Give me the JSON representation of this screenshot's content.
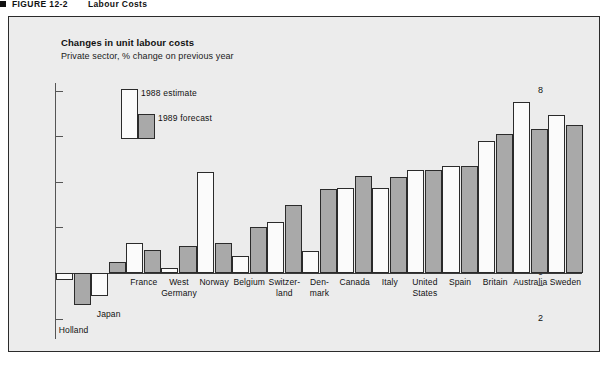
{
  "figure": {
    "marker": "square-bullet",
    "number": "FIGURE 12-2",
    "name": "Labour Costs"
  },
  "chart": {
    "title": "Changes in unit labour costs",
    "subtitle": "Private sector, % change on previous year"
  },
  "legend": {
    "series_1988": "1988 estimate",
    "series_1989": "1989 forecast"
  },
  "axis": {
    "ticks": [
      "8",
      "6",
      "4",
      "2",
      "0",
      "2"
    ],
    "plus_sign": "+",
    "minus_sign": "–"
  },
  "chart_data": {
    "type": "bar",
    "title": "Changes in unit labour costs",
    "subtitle": "Private sector, % change on previous year",
    "xlabel": "",
    "ylabel": "% change on previous year",
    "ylim": [
      -2,
      8
    ],
    "yticks": [
      -2,
      0,
      2,
      4,
      6,
      8
    ],
    "grid": false,
    "legend_position": "inside-top-left",
    "categories": [
      "Holland",
      "Japan",
      "France",
      "West\nGermany",
      "Norway",
      "Belgium",
      "Switzer-\nland",
      "Den-\nmark",
      "Canada",
      "Italy",
      "United\nStates",
      "Spain",
      "Britain",
      "Australia",
      "Sweden"
    ],
    "series": [
      {
        "name": "1988 estimate",
        "color": "#fbfbfb",
        "values": [
          -0.3,
          -1.0,
          1.3,
          0.2,
          4.45,
          0.75,
          2.25,
          0.95,
          3.75,
          3.75,
          4.5,
          4.7,
          5.8,
          7.5,
          6.95
        ]
      },
      {
        "name": "1989 forecast",
        "color": "#a9a9a9",
        "values": [
          -1.4,
          0.5,
          1.0,
          1.2,
          1.3,
          2.0,
          3.0,
          3.7,
          4.25,
          4.2,
          4.5,
          4.7,
          6.1,
          6.3,
          6.5
        ]
      }
    ]
  },
  "colors": {
    "panel_background": "#ececec",
    "panel_border": "#2b2b2b",
    "bar_1988": "#fbfbfb",
    "bar_1989": "#a9a9a9",
    "axis": "#555555",
    "text": "#111111"
  }
}
